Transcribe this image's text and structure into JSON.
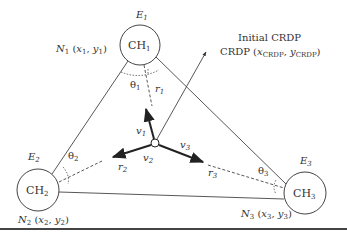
{
  "figure": {
    "nodes": [
      {
        "id": "CH1",
        "label": "CH",
        "sub": "1",
        "energy": "E",
        "energy_sub": "1",
        "pos_label": "N",
        "pos_sub": "1",
        "coords": "(x1, y1)",
        "cx": 140,
        "cy": 45,
        "r": 20
      },
      {
        "id": "CH2",
        "label": "CH",
        "sub": "2",
        "energy": "E",
        "energy_sub": "2",
        "pos_label": "N",
        "pos_sub": "2",
        "coords": "(x2, y2)",
        "cx": 38,
        "cy": 190,
        "r": 21
      },
      {
        "id": "CH3",
        "label": "CH",
        "sub": "3",
        "energy": "E",
        "energy_sub": "3",
        "pos_label": "N",
        "pos_sub": "3",
        "coords": "(x3, y3)",
        "cx": 305,
        "cy": 193,
        "r": 21
      }
    ],
    "center": {
      "cx": 155,
      "cy": 143,
      "r": 4
    },
    "crdp": {
      "title": "Initial CRDP",
      "label": "CRDP",
      "coords_x": "x",
      "coords_x_sub": "CRDP",
      "coords_y": "y",
      "coords_y_sub": "CRDP"
    },
    "vectors": [
      {
        "name": "v",
        "sub": "1"
      },
      {
        "name": "v",
        "sub": "2"
      },
      {
        "name": "v",
        "sub": "3"
      }
    ],
    "distances": [
      {
        "name": "r",
        "sub": "1"
      },
      {
        "name": "r",
        "sub": "2"
      },
      {
        "name": "r",
        "sub": "3"
      }
    ],
    "angles": [
      {
        "name": "θ",
        "sub": "1"
      },
      {
        "name": "θ",
        "sub": "2"
      },
      {
        "name": "θ",
        "sub": "3"
      }
    ]
  }
}
